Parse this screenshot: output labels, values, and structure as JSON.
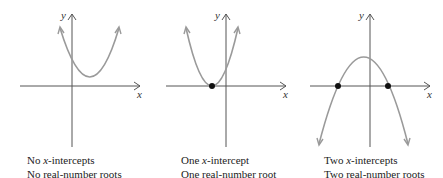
{
  "figure": {
    "axis_labels": {
      "x": "x",
      "y": "y"
    },
    "colors": {
      "axis": "#555555",
      "curve": "#9a9a9a",
      "point": "#111111",
      "text": "#222222"
    },
    "panels": [
      {
        "id": "no-roots",
        "parabola": "opens upward, vertex above x-axis",
        "x_intercepts": 0,
        "caption": {
          "line1_prefix": "No ",
          "line1_var": "x",
          "line1_suffix": "-intercepts",
          "line2": "No real-number roots"
        }
      },
      {
        "id": "one-root",
        "parabola": "opens upward, vertex on x-axis",
        "x_intercepts": 1,
        "caption": {
          "line1_prefix": "One ",
          "line1_var": "x",
          "line1_suffix": "-intercept",
          "line2": "One real-number root"
        }
      },
      {
        "id": "two-roots",
        "parabola": "opens downward, vertex above x-axis",
        "x_intercepts": 2,
        "caption": {
          "line1_prefix": "Two ",
          "line1_var": "x",
          "line1_suffix": "-intercepts",
          "line2": "Two real-number roots"
        }
      }
    ]
  }
}
